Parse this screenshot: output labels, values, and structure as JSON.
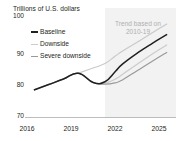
{
  "chart_data": {
    "type": "line",
    "title": "Trillions of U.S. dollars",
    "xlabel": "",
    "ylabel": "Trillions of U.S. dollars",
    "xlim": [
      2015.4,
      2025.6
    ],
    "ylim": [
      70,
      100
    ],
    "xticks": [
      "2016",
      "2019",
      "2022",
      "2025"
    ],
    "xtick_values": [
      2016,
      2019,
      2022,
      2025
    ],
    "yticks": [
      "70",
      "80",
      "90",
      "100"
    ],
    "ytick_values": [
      70,
      80,
      90,
      100
    ],
    "grid": false,
    "legend_position": "upper-left",
    "annotation": "Trend based on 2010-19",
    "annotation_line1": "Trend based on",
    "annotation_line2": "2010-19",
    "projection_start": 2020.8,
    "x": [
      2016,
      2017,
      2018,
      2019,
      2020,
      2020.8,
      2021.5,
      2022,
      2023,
      2024,
      2025
    ],
    "series": [
      {
        "name": "Baseline",
        "color": "#231f20",
        "values": [
          78.0,
          79.6,
          81.2,
          82.9,
          80.2,
          80.4,
          83.4,
          85.6,
          88.8,
          91.6,
          94.2
        ]
      },
      {
        "name": "Downside",
        "color": "#c9c9c9",
        "values": [
          78.0,
          79.6,
          81.2,
          82.9,
          80.2,
          80.0,
          81.2,
          82.6,
          85.6,
          88.5,
          91.2
        ]
      },
      {
        "name": "Severe downside",
        "color": "#9a9a9a",
        "values": [
          78.0,
          79.6,
          81.2,
          82.9,
          80.2,
          79.7,
          80.1,
          81.0,
          83.7,
          86.4,
          89.0
        ]
      },
      {
        "name": "Trend based on 2010-19",
        "color": "#c9c9c9",
        "values": [
          null,
          null,
          null,
          82.9,
          84.4,
          85.7,
          87.9,
          89.4,
          92.0,
          94.7,
          97.3
        ]
      }
    ]
  },
  "legend": {
    "items": [
      {
        "label": "Baseline",
        "color": "#231f20"
      },
      {
        "label": "Downside",
        "color": "#cccccc"
      },
      {
        "label": "Severe downside",
        "color": "#9a9a9a"
      }
    ]
  },
  "axis": {
    "ytick_100": "100",
    "ytick_90": "90",
    "ytick_80": "80",
    "ytick_70": "70",
    "xtick_2016": "2016",
    "xtick_2019": "2019",
    "xtick_2022": "2022",
    "xtick_2025": "2025"
  },
  "colors": {
    "baseline": "#231f20",
    "downside": "#cccccc",
    "severe_downside": "#9a9a9a",
    "trend": "#c9c9c9",
    "shaded_region": "#f2f2f2",
    "axis": "#b5b5b5",
    "text": "#231f20",
    "annotation_text": "#b0b0b0"
  }
}
